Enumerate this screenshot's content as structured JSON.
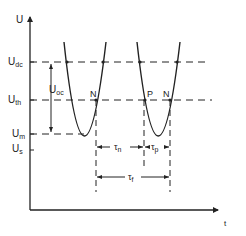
{
  "axes": {
    "y_label": "U",
    "x_label": "t"
  },
  "levels": {
    "U_dc": {
      "main": "U",
      "sub": "dc"
    },
    "U_th": {
      "main": "U",
      "sub": "th"
    },
    "U_m": {
      "main": "U",
      "sub": "m"
    },
    "U_s": {
      "main": "U",
      "sub": "s"
    },
    "U_oc": {
      "main": "U",
      "sub": "oc"
    }
  },
  "points": {
    "N1": "N",
    "P": "P",
    "N2": "N"
  },
  "intervals": {
    "tau_n": {
      "main": "τ",
      "sub": "n"
    },
    "tau_p": {
      "main": "τ",
      "sub": "p"
    },
    "tau_f": {
      "main": "τ",
      "sub": "f"
    }
  },
  "colors": {
    "ink": "#222222",
    "background": "#ffffff"
  }
}
